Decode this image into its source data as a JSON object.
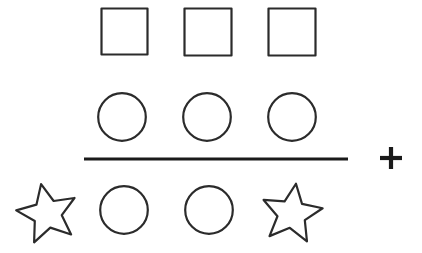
{
  "figure": {
    "title": "Shape grid with horizontal dividing line and plus sign",
    "background_color": "#ffffff",
    "outline_color": "#2b2b2b",
    "line_color": "#1a1a1a",
    "canvas": {
      "width": 422,
      "height": 253
    },
    "rows": [
      {
        "row_name": "top-row",
        "shape_type": "square",
        "count": 3,
        "items": [
          {
            "label": "square",
            "x": 101,
            "y": 8,
            "size": 47
          },
          {
            "label": "square",
            "x": 184,
            "y": 8,
            "size": 48
          },
          {
            "label": "square",
            "x": 268,
            "y": 8,
            "size": 48
          }
        ]
      },
      {
        "row_name": "middle-row",
        "shape_type": "circle",
        "count": 3,
        "items": [
          {
            "label": "circle",
            "cx": 122,
            "cy": 117,
            "r": 24
          },
          {
            "label": "circle",
            "cx": 207,
            "cy": 117,
            "r": 24
          },
          {
            "label": "circle",
            "cx": 292,
            "cy": 117,
            "r": 24
          }
        ]
      },
      {
        "row_name": "bottom-row",
        "shape_type": "mixed",
        "count": 4,
        "items": [
          {
            "label": "star",
            "cx": 47,
            "cy": 212,
            "r": 30,
            "rotation": -12
          },
          {
            "label": "circle",
            "cx": 124,
            "cy": 210,
            "r": 24
          },
          {
            "label": "circle",
            "cx": 209,
            "cy": 210,
            "r": 24
          },
          {
            "label": "star",
            "cx": 292,
            "cy": 212,
            "r": 30,
            "rotation": 8
          }
        ]
      }
    ],
    "divider": {
      "label": "horizontal-rule",
      "x1": 84,
      "y1": 159,
      "x2": 348,
      "y2": 159,
      "thickness": 3
    },
    "operator": {
      "label": "plus",
      "symbol": "+",
      "cx": 391,
      "cy": 158,
      "arm": 11
    }
  }
}
